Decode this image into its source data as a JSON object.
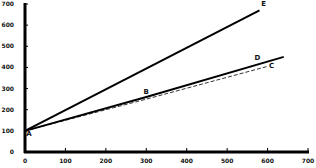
{
  "chart_data": {
    "type": "line",
    "title": "",
    "xlabel": "",
    "ylabel": "",
    "xlim": [
      0,
      700
    ],
    "ylim": [
      0,
      700
    ],
    "x_ticks": [
      "0",
      "100",
      "200",
      "300",
      "400",
      "500",
      "600",
      "700"
    ],
    "y_ticks": [
      "0",
      "100",
      "200",
      "300",
      "400",
      "500",
      "600",
      "700"
    ],
    "grid": false,
    "series": [
      {
        "name": "A-E",
        "style": "solid",
        "points": [
          [
            0,
            100
          ],
          [
            580,
            670
          ]
        ]
      },
      {
        "name": "A-D",
        "style": "solid",
        "points": [
          [
            0,
            100
          ],
          [
            300,
            260
          ],
          [
            640,
            450
          ]
        ]
      },
      {
        "name": "A-C",
        "style": "dashed",
        "points": [
          [
            0,
            100
          ],
          [
            300,
            250
          ],
          [
            600,
            405
          ]
        ]
      }
    ],
    "annotations": [
      {
        "label": "A",
        "x": 10,
        "y": 75
      },
      {
        "label": "B",
        "x": 300,
        "y": 275
      },
      {
        "label": "C",
        "x": 610,
        "y": 395
      },
      {
        "label": "D",
        "x": 575,
        "y": 435
      },
      {
        "label": "E",
        "x": 590,
        "y": 690
      }
    ]
  }
}
